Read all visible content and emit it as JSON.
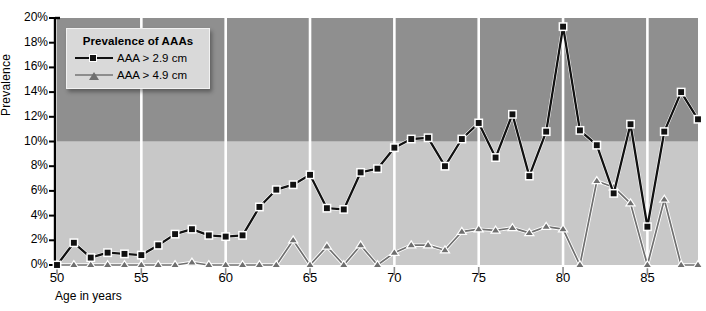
{
  "legend": {
    "title": "Prevalence of AAAs",
    "entries": [
      {
        "label": "AAA > 2.9 cm",
        "marker": "square",
        "color": "#111111"
      },
      {
        "label": "AAA > 4.9 cm",
        "marker": "triangle",
        "color": "#6f6f6f"
      }
    ]
  },
  "chart_data": {
    "type": "line",
    "title": "Prevalence of AAAs",
    "xlabel": "Age in years",
    "ylabel": "Prevalence",
    "xlim": [
      50,
      88
    ],
    "ylim": [
      0,
      20
    ],
    "yunit": "%",
    "grid": "vertical-white-every-5-years",
    "xticks": [
      50,
      55,
      60,
      65,
      70,
      75,
      80,
      85
    ],
    "xticklabels": [
      "50",
      "55",
      "60",
      "65",
      "70",
      "75",
      "80",
      "85"
    ],
    "yticks": [
      0,
      2,
      4,
      6,
      8,
      10,
      12,
      14,
      16,
      18,
      20
    ],
    "yticklabels": [
      "0%",
      "2%",
      "4%",
      "6%",
      "8%",
      "10%",
      "12%",
      "14%",
      "16%",
      "18%",
      "20%"
    ],
    "background_bands": [
      {
        "from": 0,
        "to": 10,
        "color": "#c8c8c8"
      },
      {
        "from": 10,
        "to": 20,
        "color": "#8f8f8f"
      }
    ],
    "x": [
      50,
      51,
      52,
      53,
      54,
      55,
      56,
      57,
      58,
      59,
      60,
      61,
      62,
      63,
      64,
      65,
      66,
      67,
      68,
      69,
      70,
      71,
      72,
      73,
      74,
      75,
      76,
      77,
      78,
      79,
      80,
      81,
      82,
      83,
      84,
      85,
      86,
      87,
      88
    ],
    "series": [
      {
        "name": "AAA > 2.9 cm",
        "color": "#111111",
        "marker": "square",
        "values": [
          0.0,
          1.8,
          0.6,
          1.0,
          0.9,
          0.8,
          1.6,
          2.5,
          2.9,
          2.4,
          2.3,
          2.4,
          4.7,
          6.1,
          6.5,
          7.3,
          4.6,
          4.5,
          7.5,
          7.8,
          9.5,
          10.2,
          10.3,
          8.0,
          10.2,
          11.5,
          8.7,
          12.2,
          7.2,
          10.8,
          19.3,
          10.9,
          9.7,
          5.8,
          11.4,
          3.1,
          10.8,
          14.0,
          11.8
        ]
      },
      {
        "name": "AAA > 4.9 cm",
        "color": "#6f6f6f",
        "marker": "triangle",
        "values": [
          0.0,
          0.0,
          0.0,
          0.0,
          0.0,
          0.0,
          0.0,
          0.0,
          0.2,
          0.0,
          0.0,
          0.0,
          0.0,
          0.0,
          2.0,
          0.0,
          1.5,
          0.0,
          1.6,
          0.0,
          1.0,
          1.6,
          1.6,
          1.2,
          2.7,
          2.9,
          2.8,
          3.0,
          2.6,
          3.1,
          2.9,
          0.0,
          6.8,
          6.3,
          5.0,
          0.0,
          5.3,
          0.0,
          0.0
        ]
      }
    ]
  },
  "axis": {
    "xlabel": "Age in years",
    "ylabel": "Prevalence"
  }
}
